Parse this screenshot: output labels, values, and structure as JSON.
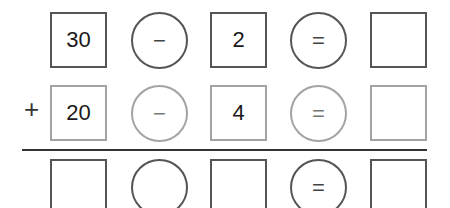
{
  "worksheet": {
    "rows": [
      {
        "style": "dark",
        "cells": [
          {
            "type": "box",
            "value": "30"
          },
          {
            "type": "circle",
            "value": "−"
          },
          {
            "type": "box",
            "value": "2"
          },
          {
            "type": "circle",
            "value": "="
          },
          {
            "type": "box",
            "value": ""
          }
        ]
      },
      {
        "style": "gray",
        "prefix": "+",
        "cells": [
          {
            "type": "box",
            "value": "20"
          },
          {
            "type": "circle",
            "value": "−"
          },
          {
            "type": "box",
            "value": "4"
          },
          {
            "type": "circle",
            "value": "="
          },
          {
            "type": "box",
            "value": ""
          }
        ]
      },
      {
        "style": "dark",
        "cells": [
          {
            "type": "box",
            "value": ""
          },
          {
            "type": "circle",
            "value": ""
          },
          {
            "type": "box",
            "value": ""
          },
          {
            "type": "circle",
            "value": "="
          },
          {
            "type": "box",
            "value": ""
          }
        ]
      }
    ],
    "colors": {
      "dark_border": "#555555",
      "gray_border": "#a3a3a3",
      "rule": "#333333"
    }
  }
}
